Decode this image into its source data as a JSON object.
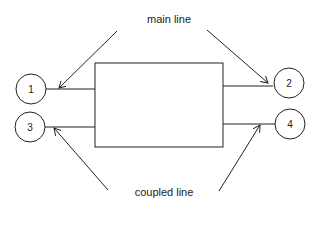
{
  "labels": {
    "main_line": "main line",
    "coupled_line": "coupled line"
  },
  "ports": [
    {
      "id": "1"
    },
    {
      "id": "2"
    },
    {
      "id": "3"
    },
    {
      "id": "4"
    }
  ],
  "colors": {
    "stroke": "#222222",
    "background": "#ffffff"
  }
}
